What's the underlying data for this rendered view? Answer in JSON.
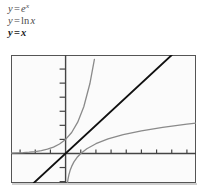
{
  "figure": {
    "kind": "math-function-graph",
    "background_color": "#ffffff",
    "plot_background_color": "#fbfbfb",
    "frame_color": "#555555"
  },
  "legend": {
    "entries": [
      {
        "id": "exponential",
        "lhs": "y",
        "equals": "=",
        "base": "e",
        "exponent": "x",
        "plain": "y = e^x",
        "color": "#4a4a4a",
        "emphasis": false
      },
      {
        "id": "logarithm",
        "lhs": "y",
        "equals": "=",
        "fn": "ln",
        "arg": "x",
        "plain": "y = ln x",
        "color": "#4a4a4a",
        "emphasis": false
      },
      {
        "id": "identity",
        "lhs": "y",
        "equals": "=",
        "arg": "x",
        "plain": "y = x",
        "color": "#1a1a1a",
        "emphasis": true
      }
    ]
  },
  "chart_data": {
    "type": "line",
    "title": "",
    "xlabel": "",
    "ylabel": "",
    "xlim": [
      -3.6,
      8.6
    ],
    "ylim": [
      -2.1,
      7.0
    ],
    "grid": false,
    "legend_position": "above-plot",
    "axes": {
      "x_axis_y": 0,
      "y_axis_x": 0,
      "axis_color": "#444444",
      "tick_spacing_x": 1,
      "tick_spacing_y": 1,
      "x_ticks": [
        -3,
        -2,
        -1,
        1,
        2,
        3,
        4,
        5,
        6,
        7,
        8
      ],
      "y_ticks": [
        1,
        2,
        3,
        4,
        5,
        6,
        -1,
        -2
      ],
      "tick_labels_shown": false
    },
    "series": [
      {
        "name": "y = e^x",
        "id": "exponential",
        "color": "#8a8a8a",
        "width": 1.3,
        "x": [
          -3.6,
          -3.2,
          -2.8,
          -2.4,
          -2.0,
          -1.6,
          -1.2,
          -0.8,
          -0.4,
          0.0,
          0.4,
          0.8,
          1.2,
          1.6,
          1.9
        ],
        "y": [
          0.027,
          0.041,
          0.061,
          0.091,
          0.135,
          0.202,
          0.301,
          0.449,
          0.67,
          1.0,
          1.492,
          2.226,
          3.32,
          4.953,
          6.686
        ]
      },
      {
        "name": "y = ln x",
        "id": "logarithm",
        "color": "#8a8a8a",
        "width": 1.3,
        "x": [
          0.12,
          0.16,
          0.22,
          0.3,
          0.4,
          0.55,
          0.75,
          1.0,
          1.4,
          2.0,
          2.8,
          3.8,
          5.0,
          6.4,
          8.0,
          8.6
        ],
        "y": [
          -2.12,
          -1.83,
          -1.51,
          -1.2,
          -0.92,
          -0.6,
          -0.29,
          0.0,
          0.336,
          0.693,
          1.03,
          1.335,
          1.609,
          1.856,
          2.079,
          2.152
        ]
      },
      {
        "name": "y = x",
        "id": "identity",
        "color": "#111111",
        "width": 1.8,
        "x": [
          -2.1,
          7.0
        ],
        "y": [
          -2.1,
          7.0
        ]
      }
    ]
  }
}
